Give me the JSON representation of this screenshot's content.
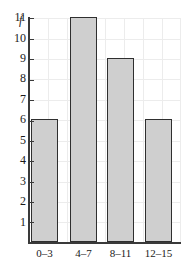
{
  "chart_data": {
    "type": "bar",
    "title": "",
    "xlabel": "",
    "ylabel": "f",
    "categories": [
      "0–3",
      "4–7",
      "8–11",
      "12–15"
    ],
    "values": [
      6,
      11,
      9,
      6
    ],
    "ylim": [
      0,
      11.6
    ],
    "yticks": [
      1,
      2,
      3,
      4,
      5,
      6,
      7,
      8,
      9,
      10,
      11
    ],
    "ytick_labels": [
      "1",
      "2",
      "3",
      "4",
      "5",
      "6",
      "7",
      "8",
      "9",
      "10",
      "11"
    ],
    "grid": true,
    "legend": false,
    "bar_fill_color": "#cfcfcf",
    "bar_edge_color": "#2f2f2f",
    "axis_color": "#3a3a3a",
    "grid_color": "#ececec",
    "text_color": "#1a1a1a",
    "background_color": "#ffffff"
  }
}
